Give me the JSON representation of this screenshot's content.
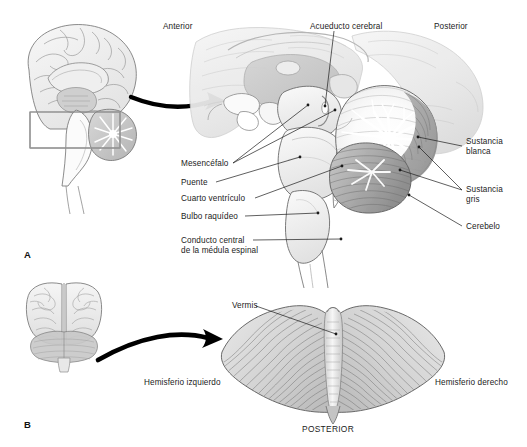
{
  "figure": {
    "language": "es",
    "background_color": "#ffffff",
    "ink_color": "#1b1b1b",
    "panels": [
      {
        "letter": "A",
        "description": "Corte sagital medio del tronco encefalico y cerebelo",
        "orientation_labels": {
          "anterior": "Anterior",
          "posterior": "Posterior"
        }
      },
      {
        "letter": "B",
        "description": "Vista superior del cerebelo",
        "orientation_labels": {
          "posterior": "POSTERIOR"
        }
      }
    ]
  },
  "panel_a": {
    "letter": "A",
    "anterior_label": "Anterior",
    "posterior_label": "Posterior",
    "labels": {
      "acueducto_cerebral": "Acueducto cerebral",
      "mesencefalo": "Mesencéfalo",
      "puente": "Puente",
      "cuarto_ventriculo": "Cuarto ventrículo",
      "bulbo_raquideo": "Bulbo raquídeo",
      "conducto_central_line1": "Conducto central",
      "conducto_central_line2": "de la médula espinal",
      "sustancia_blanca_line1": "Sustancia",
      "sustancia_blanca_line2": "blanca",
      "sustancia_gris_line1": "Sustancia",
      "sustancia_gris_line2": "gris",
      "cerebelo": "Cerebelo"
    }
  },
  "panel_b": {
    "letter": "B",
    "labels": {
      "vermis": "Vermis",
      "hemisferio_izquierdo": "Hemisferio izquierdo",
      "hemisferio_derecho": "Hemisferio derecho",
      "posterior": "POSTERIOR"
    }
  },
  "colors": {
    "ink": "#1b1b1b",
    "outline": "#555555",
    "light_tissue": "#f2f2f2",
    "mid_tissue": "#d9d9d9",
    "dark_tissue": "#a8a8a8",
    "white_matter": "#ffffff",
    "arrow": "#000000"
  }
}
